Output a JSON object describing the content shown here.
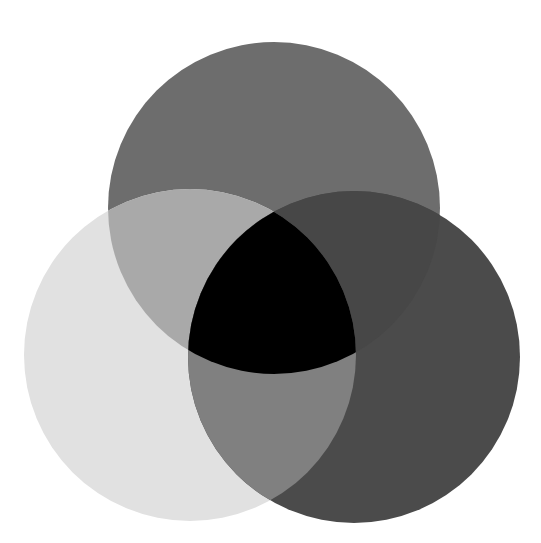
{
  "diagram": {
    "type": "venn",
    "set_count": 3,
    "labels_visible": false,
    "background": "#ffffff",
    "sets": [
      {
        "id": "top",
        "cx": 274,
        "cy": 208,
        "r": 166,
        "color": "#6d6d6d"
      },
      {
        "id": "left",
        "cx": 190,
        "cy": 355,
        "r": 166,
        "color": "#e1e1e1"
      },
      {
        "id": "right",
        "cx": 354,
        "cy": 357,
        "r": 166,
        "color": "#4b4b4b"
      }
    ],
    "overlaps": {
      "top_left": "#a9a9a9",
      "top_right": "#474747",
      "left_right": "#808080",
      "top_left_right": "#000000"
    }
  }
}
